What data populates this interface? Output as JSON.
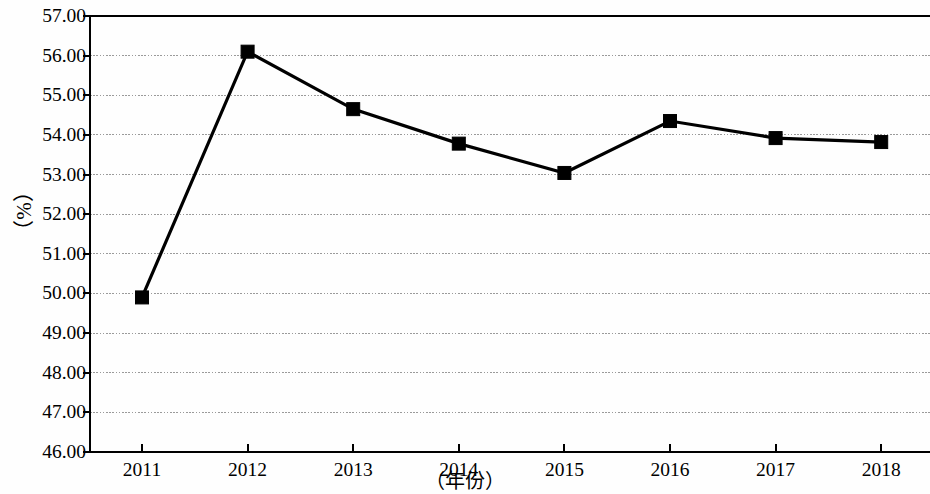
{
  "chart_data": {
    "type": "line",
    "title": "",
    "subtitle": "",
    "xlabel": "（年份）",
    "ylabel": "（%）",
    "categories": [
      "2011",
      "2012",
      "2013",
      "2014",
      "2015",
      "2016",
      "2017",
      "2018"
    ],
    "values": [
      49.9,
      56.1,
      54.65,
      53.78,
      53.04,
      54.35,
      53.92,
      53.82
    ],
    "series": [
      {
        "name": "",
        "values": [
          49.9,
          56.1,
          54.65,
          53.78,
          53.04,
          54.35,
          53.92,
          53.82
        ],
        "marker": "square",
        "color": "#000000"
      }
    ],
    "ylim": [
      46.0,
      57.0
    ],
    "ytick_labels": [
      "57.00",
      "56.00",
      "55.00",
      "54.00",
      "53.00",
      "52.00",
      "51.00",
      "50.00",
      "49.00",
      "48.00",
      "47.00",
      "46.00"
    ],
    "ytick_values": [
      57.0,
      56.0,
      55.0,
      54.0,
      53.0,
      52.0,
      51.0,
      50.0,
      49.0,
      48.0,
      47.0,
      46.0
    ],
    "ytick_step": 1.0,
    "xtick_labels": [
      "2011",
      "2012",
      "2013",
      "2014",
      "2015",
      "2016",
      "2017",
      "2018"
    ],
    "grid": {
      "horizontal": true,
      "vertical": false,
      "color": "#9a9a9a",
      "style": "dotted"
    },
    "legend": {
      "visible": false,
      "position": "none",
      "entries": []
    },
    "axis_color": "#000000",
    "line_color": "#000000",
    "marker_color": "#000000",
    "background": "#ffffff"
  },
  "axes": {
    "y_label_text": "（%）",
    "x_label_text": "（年份）"
  }
}
